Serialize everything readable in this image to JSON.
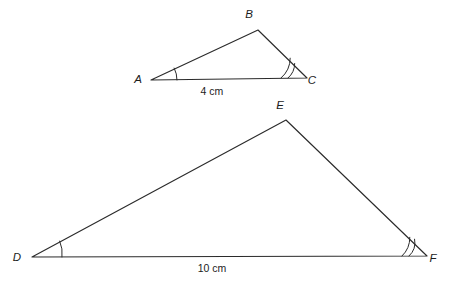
{
  "figure": {
    "background_color": "#ffffff",
    "stroke_color": "#2b2b2b",
    "label_color": "#1c1c1c"
  },
  "triangles": [
    {
      "name": "triangle-abc",
      "vertices": [
        {
          "label": "A",
          "x": 151,
          "y": 80,
          "label_x": 138,
          "label_y": 83
        },
        {
          "label": "B",
          "x": 258,
          "y": 30,
          "label_x": 249,
          "label_y": 18
        },
        {
          "label": "C",
          "x": 307,
          "y": 78,
          "label_x": 312,
          "label_y": 84
        }
      ],
      "path": "M 151 80 L 258 30 L 307 78 Z",
      "side_label": {
        "text": "4 cm",
        "x": 212,
        "y": 95
      },
      "angle_marks": [
        {
          "at": "A",
          "arcs": 1,
          "arc_paths": [
            "M 177 80 A 26 26 0 0 0 174.2 68.1"
          ]
        },
        {
          "at": "C",
          "arcs": 2,
          "arc_paths": [
            "M 288 78 A 19 19 0 0 0 294.7 63.5",
            "M 281 78 A 26 26 0 0 0 290.2 58.2"
          ]
        }
      ]
    },
    {
      "name": "triangle-def",
      "vertices": [
        {
          "label": "D",
          "x": 32,
          "y": 257,
          "label_x": 17,
          "label_y": 261
        },
        {
          "label": "E",
          "x": 286,
          "y": 120,
          "label_x": 280,
          "label_y": 109
        },
        {
          "label": "F",
          "x": 427,
          "y": 256,
          "label_x": 433,
          "label_y": 262
        }
      ],
      "path": "M 32 257 L 286 120 L 427 256 Z",
      "side_label": {
        "text": "10 cm",
        "x": 212,
        "y": 272
      },
      "angle_marks": [
        {
          "at": "D",
          "arcs": 1,
          "arc_paths": [
            "M 62 257 A 30 30 0 0 0 59.7 241.1"
          ]
        },
        {
          "at": "F",
          "arcs": 2,
          "arc_paths": [
            "M 409 256 A 18 18 0 0 0 414.6 239.2",
            "M 402 256 A 25 25 0 0 0 409.8 237.3"
          ]
        }
      ]
    }
  ]
}
